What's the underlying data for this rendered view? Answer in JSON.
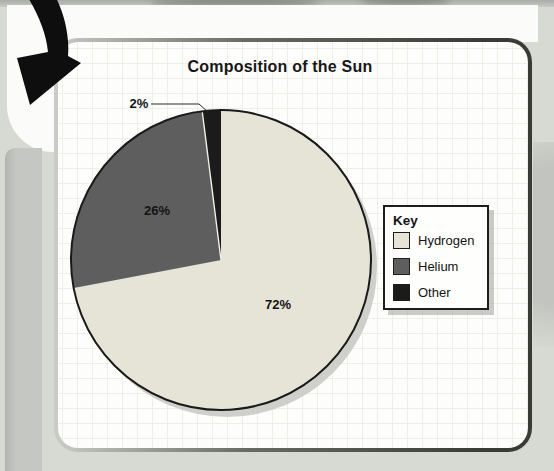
{
  "chart_data": {
    "type": "pie",
    "title": "Composition of the Sun",
    "slices": [
      {
        "label": "Hydrogen",
        "value": 72,
        "pct_label": "72%",
        "color": "#e6e4d6"
      },
      {
        "label": "Helium",
        "value": 26,
        "pct_label": "26%",
        "color": "#5e5e5e"
      },
      {
        "label": "Other",
        "value": 2,
        "pct_label": "2%",
        "color": "#1b1b1b"
      }
    ],
    "start_angle": "top",
    "direction": "clockwise",
    "outline_color": "#1a1a1a",
    "legend_title": "Key",
    "legend_position": "right"
  }
}
